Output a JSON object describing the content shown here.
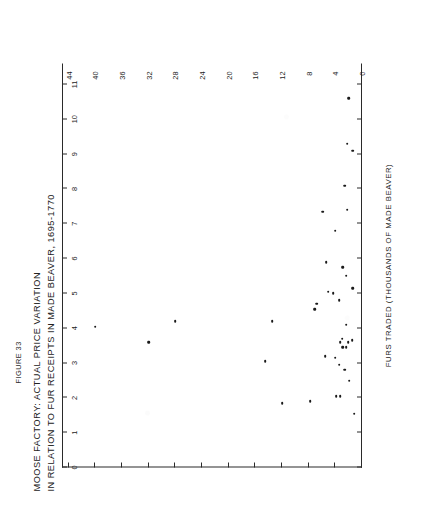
{
  "figure": {
    "figure_number": "FIGURE 33",
    "title_line_1": "MOOSE FACTORY: ACTUAL PRICE VARIATION",
    "title_line_2": "IN RELATION TO FUR RECEIPTS IN MADE BEAVER, 1695-1770"
  },
  "chart_data": {
    "type": "scatter",
    "title": "MOOSE FACTORY: ACTUAL PRICE VARIATION IN RELATION TO FUR RECEIPTS IN MADE BEAVER, 1695-1770",
    "subtitle": "FIGURE 33",
    "xlabel": "FURS TRADED (THOUSANDS OF MADE BEAVER)",
    "ylabel": "GOODS TRADED PER UNIT OF OVERPLUS GAINED",
    "xlim": [
      0,
      11.6
    ],
    "ylim": [
      0,
      45
    ],
    "xticks": [
      0,
      1,
      2,
      3,
      4,
      5,
      6,
      7,
      8,
      9,
      10,
      11
    ],
    "xticklabels": [
      "0",
      "1",
      "2",
      "3",
      "4",
      "5",
      "6",
      "7",
      "8",
      "9",
      "10",
      "11"
    ],
    "yticks": [
      0,
      4,
      8,
      12,
      16,
      20,
      24,
      28,
      32,
      36,
      40,
      44
    ],
    "yticklabels": [
      "0",
      "4",
      "8",
      "12",
      "16",
      "20",
      "24",
      "28",
      "32",
      "36",
      "40",
      "44"
    ],
    "grid": false,
    "legend": "none",
    "marker": "dot",
    "marker_color": "#1a1a1a",
    "points": [
      {
        "x": 1.55,
        "y": 1.2
      },
      {
        "x": 1.9,
        "y": 7.8
      },
      {
        "x": 1.85,
        "y": 12.0
      },
      {
        "x": 2.05,
        "y": 3.9
      },
      {
        "x": 2.05,
        "y": 3.3
      },
      {
        "x": 2.5,
        "y": 1.9
      },
      {
        "x": 2.8,
        "y": 2.6
      },
      {
        "x": 2.95,
        "y": 3.4
      },
      {
        "x": 3.05,
        "y": 14.5
      },
      {
        "x": 3.15,
        "y": 4.0
      },
      {
        "x": 3.2,
        "y": 5.5
      },
      {
        "x": 3.45,
        "y": 2.4
      },
      {
        "x": 3.45,
        "y": 2.9
      },
      {
        "x": 3.6,
        "y": 2.1
      },
      {
        "x": 3.6,
        "y": 3.3
      },
      {
        "x": 3.65,
        "y": 1.5
      },
      {
        "x": 3.7,
        "y": 3.0
      },
      {
        "x": 3.6,
        "y": 32.0
      },
      {
        "x": 4.05,
        "y": 40.0
      },
      {
        "x": 4.1,
        "y": 2.4
      },
      {
        "x": 4.2,
        "y": 28.0
      },
      {
        "x": 4.2,
        "y": 13.5
      },
      {
        "x": 4.55,
        "y": 7.1
      },
      {
        "x": 4.7,
        "y": 6.8
      },
      {
        "x": 4.8,
        "y": 3.4
      },
      {
        "x": 5.0,
        "y": 4.3
      },
      {
        "x": 5.05,
        "y": 5.1
      },
      {
        "x": 5.15,
        "y": 1.4
      },
      {
        "x": 5.5,
        "y": 2.4
      },
      {
        "x": 5.75,
        "y": 2.9
      },
      {
        "x": 5.9,
        "y": 5.4
      },
      {
        "x": 6.8,
        "y": 4.0
      },
      {
        "x": 7.35,
        "y": 5.9
      },
      {
        "x": 7.4,
        "y": 2.2
      },
      {
        "x": 8.1,
        "y": 2.6
      },
      {
        "x": 9.1,
        "y": 1.4
      },
      {
        "x": 9.3,
        "y": 2.2
      },
      {
        "x": 10.6,
        "y": 2.0
      }
    ]
  }
}
